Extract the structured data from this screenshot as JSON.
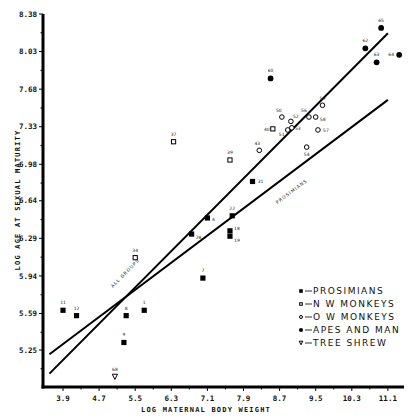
{
  "chart_data": {
    "type": "scatter",
    "title": "",
    "xlabel": "LOG MATERNAL BODY WEIGHT",
    "ylabel": "LOG AGE AT SEXUAL MATURITY",
    "xlim": [
      3.6,
      11.5
    ],
    "ylim": [
      4.84,
      8.38
    ],
    "x_ticks": [
      "3.9",
      "4.7",
      "5.5",
      "6.3",
      "7.1",
      "7.9",
      "8.7",
      "9.5",
      "10.3",
      "11.1"
    ],
    "y_ticks": [
      "8.38",
      "8.03",
      "7.68",
      "7.33",
      "6.98",
      "6.64",
      "6.29",
      "5.94",
      "5.59",
      "5.25"
    ],
    "grid": false,
    "legend_position": "lower right",
    "legend": [
      {
        "marker": "filled-square",
        "label": "PROSIMIANS"
      },
      {
        "marker": "open-square",
        "label": "N W MONKEYS"
      },
      {
        "marker": "open-circle",
        "label": "O W MONKEYS"
      },
      {
        "marker": "filled-circle",
        "label": "APES AND MAN"
      },
      {
        "marker": "open-triangle-down",
        "label": "TREE SHREW"
      }
    ],
    "series": [
      {
        "name": "PROSIMIANS",
        "marker": "filled-square",
        "points": [
          {
            "id": "11",
            "x": 3.9,
            "y": 5.62
          },
          {
            "id": "12",
            "x": 4.2,
            "y": 5.57
          },
          {
            "id": "9",
            "x": 5.25,
            "y": 5.32
          },
          {
            "id": "8",
            "x": 5.3,
            "y": 5.57
          },
          {
            "id": "1",
            "x": 5.7,
            "y": 5.62
          },
          {
            "id": "7",
            "x": 7.0,
            "y": 5.92
          },
          {
            "id": "28",
            "x": 6.75,
            "y": 6.33
          },
          {
            "id": "4",
            "x": 7.1,
            "y": 6.48
          },
          {
            "id": "18",
            "x": 7.6,
            "y": 6.36
          },
          {
            "id": "19",
            "x": 7.6,
            "y": 6.31
          },
          {
            "id": "22",
            "x": 7.65,
            "y": 6.5
          },
          {
            "id": "31",
            "x": 8.1,
            "y": 6.82
          }
        ]
      },
      {
        "name": "N W MONKEYS",
        "marker": "open-square",
        "points": [
          {
            "id": "34",
            "x": 5.5,
            "y": 6.11
          },
          {
            "id": "37",
            "x": 6.35,
            "y": 7.19
          },
          {
            "id": "39",
            "x": 7.6,
            "y": 7.02
          },
          {
            "id": "40",
            "x": 8.55,
            "y": 7.31
          }
        ]
      },
      {
        "name": "O W MONKEYS",
        "marker": "open-circle",
        "points": [
          {
            "id": "43",
            "x": 8.25,
            "y": 7.11
          },
          {
            "id": "50",
            "x": 8.75,
            "y": 7.42
          },
          {
            "id": "51",
            "x": 8.88,
            "y": 7.3
          },
          {
            "id": "52",
            "x": 8.95,
            "y": 7.38
          },
          {
            "id": "53",
            "x": 8.97,
            "y": 7.32
          },
          {
            "id": "54",
            "x": 9.3,
            "y": 7.14
          },
          {
            "id": "56",
            "x": 9.35,
            "y": 7.42
          },
          {
            "id": "57",
            "x": 9.55,
            "y": 7.3
          },
          {
            "id": "58",
            "x": 9.5,
            "y": 7.42
          },
          {
            "id": "59",
            "x": 9.65,
            "y": 7.53
          }
        ]
      },
      {
        "name": "APES AND MAN",
        "marker": "filled-circle",
        "points": [
          {
            "id": "60",
            "x": 8.5,
            "y": 7.78
          },
          {
            "id": "62",
            "x": 10.6,
            "y": 8.06
          },
          {
            "id": "63",
            "x": 10.85,
            "y": 7.93
          },
          {
            "id": "64",
            "x": 11.35,
            "y": 8.0
          },
          {
            "id": "65",
            "x": 10.95,
            "y": 8.25
          }
        ]
      },
      {
        "name": "TREE SHREW",
        "marker": "open-triangle-down",
        "points": [
          {
            "id": "68",
            "x": 5.05,
            "y": 5.0
          }
        ]
      }
    ],
    "regression_lines": [
      {
        "name": "ALL GROUPS",
        "x0": 3.6,
        "y0": 5.03,
        "x1": 11.1,
        "y1": 8.2
      },
      {
        "name": "PROSIMIANS",
        "x0": 3.6,
        "y0": 5.21,
        "x1": 11.1,
        "y1": 7.58
      }
    ]
  }
}
